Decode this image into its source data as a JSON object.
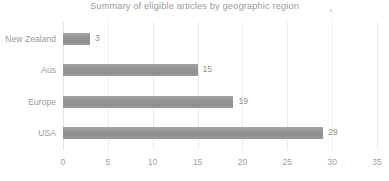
{
  "chart_data": {
    "type": "bar",
    "orientation": "horizontal",
    "title": "Summary of eligible articles by geographic region",
    "xlabel": "",
    "ylabel": "",
    "categories": [
      "New Zealand",
      "Aus",
      "Europe",
      "USA"
    ],
    "values": [
      3,
      15,
      19,
      29
    ],
    "data_labels": [
      "3",
      "15",
      "19",
      "29"
    ],
    "xlim": [
      0,
      35
    ],
    "xticks": [
      0,
      5,
      10,
      15,
      20,
      25,
      30,
      35
    ],
    "xtick_labels": [
      "0",
      "5",
      "10",
      "15",
      "20",
      "25",
      "30",
      "35"
    ],
    "grid": true,
    "grid_axis": "x",
    "legend": false,
    "legend_position": "none",
    "series": [
      {
        "name": "Eligible articles",
        "values": [
          3,
          15,
          19,
          29
        ]
      }
    ],
    "colors": {
      "bar": "#969696",
      "gridline": "#eceaea",
      "title_text": "#9b9b9b",
      "label_text": "#9b9b9b",
      "tick_text": "#a0a0a0",
      "background": "#ffffff"
    }
  }
}
